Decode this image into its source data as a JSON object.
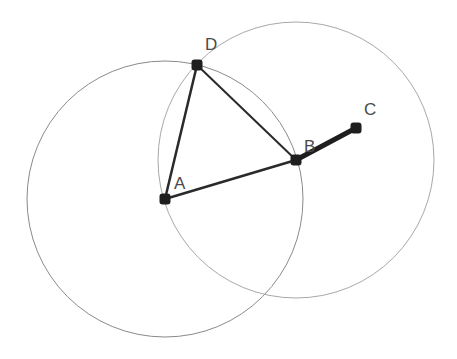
{
  "diagram": {
    "type": "geometric-construction",
    "points": [
      {
        "id": "A",
        "label": "A",
        "x": 165,
        "y": 199,
        "lx": 174,
        "ly": 189
      },
      {
        "id": "B",
        "label": "B",
        "x": 296,
        "y": 160,
        "lx": 304,
        "ly": 152
      },
      {
        "id": "C",
        "label": "C",
        "x": 356,
        "y": 128,
        "lx": 364,
        "ly": 115
      },
      {
        "id": "D",
        "label": "D",
        "x": 197,
        "y": 65,
        "lx": 205,
        "ly": 50
      }
    ],
    "circles": [
      {
        "id": "circle-A",
        "center": "A",
        "cx": 165,
        "cy": 199,
        "r": 138,
        "color": "#8a8a8a"
      },
      {
        "id": "circle-B",
        "center": "B",
        "cx": 296,
        "cy": 160,
        "r": 138,
        "color": "#a8a8a8"
      }
    ],
    "segments": [
      {
        "id": "AB",
        "from": "A",
        "to": "B",
        "width": 2.5
      },
      {
        "id": "AD",
        "from": "A",
        "to": "D",
        "width": 2.5
      },
      {
        "id": "BD",
        "from": "B",
        "to": "D",
        "width": 2
      },
      {
        "id": "BC",
        "from": "B",
        "to": "C",
        "width": 5
      }
    ],
    "colors": {
      "line": "#2a2a2a",
      "point": "#1e1e1e",
      "label": "#4a4a4a"
    }
  }
}
